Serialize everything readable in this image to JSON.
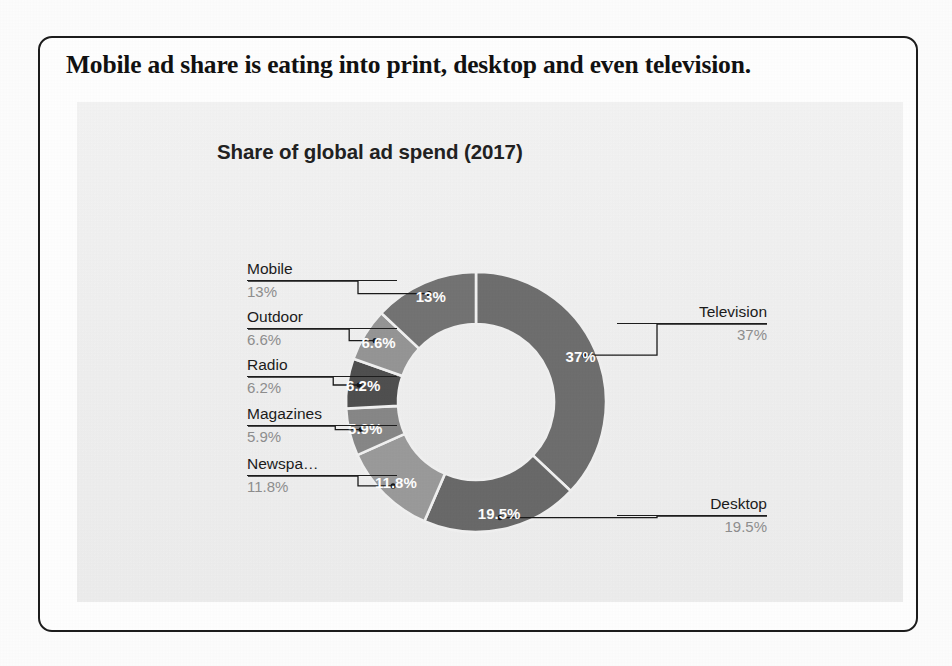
{
  "page": {
    "headline": "Mobile ad share is eating into print, desktop and even television."
  },
  "chart_data": {
    "type": "pie",
    "variant": "donut",
    "title": "Share of global ad spend (2017)",
    "xlabel": "",
    "ylabel": "",
    "units": "percent",
    "start_angle_deg": 0,
    "direction": "clockwise",
    "legend": "callout-labels",
    "grid": false,
    "categories": [
      "Television",
      "Desktop",
      "Newspapers",
      "Magazines",
      "Radio",
      "Outdoor",
      "Mobile"
    ],
    "values": [
      37,
      19.5,
      11.8,
      5.9,
      6.2,
      6.6,
      13
    ],
    "value_labels": [
      "37%",
      "19.5%",
      "11.8%",
      "5.9%",
      "6.2%",
      "6.6%",
      "13%"
    ],
    "colors": [
      "#6e6e6e",
      "#696969",
      "#9a9a9a",
      "#878787",
      "#4f4f4f",
      "#959595",
      "#737373"
    ],
    "slices": [
      {
        "name": "Television",
        "display_name": "Television",
        "value": 37,
        "label": "37%",
        "color": "#6e6e6e",
        "callout_side": "right"
      },
      {
        "name": "Desktop",
        "display_name": "Desktop",
        "value": 19.5,
        "label": "19.5%",
        "color": "#696969",
        "callout_side": "right"
      },
      {
        "name": "Newspapers",
        "display_name": "Newspa…",
        "value": 11.8,
        "label": "11.8%",
        "color": "#9a9a9a",
        "callout_side": "left"
      },
      {
        "name": "Magazines",
        "display_name": "Magazines",
        "value": 5.9,
        "label": "5.9%",
        "color": "#878787",
        "callout_side": "left"
      },
      {
        "name": "Radio",
        "display_name": "Radio",
        "value": 6.2,
        "label": "6.2%",
        "color": "#4f4f4f",
        "callout_side": "left"
      },
      {
        "name": "Outdoor",
        "display_name": "Outdoor",
        "value": 6.6,
        "label": "6.6%",
        "color": "#959595",
        "callout_side": "left"
      },
      {
        "name": "Mobile",
        "display_name": "Mobile",
        "value": 13,
        "label": "13%",
        "color": "#737373",
        "callout_side": "left"
      }
    ]
  },
  "callouts": {
    "left": [
      {
        "name": "Mobile",
        "value": "13%"
      },
      {
        "name": "Outdoor",
        "value": "6.6%"
      },
      {
        "name": "Radio",
        "value": "6.2%"
      },
      {
        "name": "Magazines",
        "value": "5.9%"
      },
      {
        "name": "Newspa…",
        "value": "11.8%"
      }
    ],
    "right": [
      {
        "name": "Television",
        "value": "37%"
      },
      {
        "name": "Desktop",
        "value": "19.5%"
      }
    ]
  },
  "theme": {
    "card_border": "#1c1c1c",
    "panel_background": "#f1f1f1",
    "headline_color": "#111111",
    "title_color": "#212121",
    "label_name_color": "#1b1b1b",
    "label_value_color": "#8e8e8e",
    "slice_label_color": "#ffffff",
    "leader_color": "#1a1a1a"
  }
}
